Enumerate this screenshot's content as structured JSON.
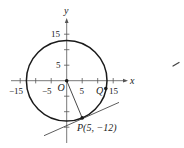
{
  "figure": {
    "type": "coordinate-plane-circle-tangent",
    "axes": {
      "x_label": "x",
      "y_label": "y",
      "x_ticks": [
        -15,
        -10,
        -5,
        5,
        10,
        15
      ],
      "y_ticks": [
        -15,
        -10,
        -5,
        5,
        10,
        15
      ],
      "x_tick_labels": [
        "−15",
        "−5",
        "5",
        "15"
      ],
      "y_tick_labels": [
        "15",
        "5"
      ]
    },
    "circle": {
      "center": [
        0,
        0
      ],
      "radius": 13
    },
    "points": {
      "origin": {
        "label": "O",
        "coords": [
          0,
          0
        ]
      },
      "P": {
        "label": "P(5, −12)",
        "coords": [
          5,
          -12
        ]
      },
      "Q": {
        "label": "Q",
        "coords": [
          12.6,
          -2.5
        ]
      }
    },
    "segments": [
      {
        "from": "O",
        "to": "P"
      }
    ],
    "tangent_line": {
      "through": "P",
      "slope": 0.4167
    },
    "colors": {
      "stroke": "#1a1a1a",
      "axis": "#555555"
    }
  }
}
